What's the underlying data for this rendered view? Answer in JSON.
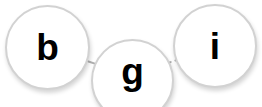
{
  "diagram": {
    "type": "node-link-graph",
    "background_color": "#ffffff",
    "node_fill_color": "#ffffff",
    "node_border_color": "#d2d2d2",
    "label_color": "#000000",
    "edge_color": "#b0b0b0",
    "edge_style": "dashed",
    "nodes": [
      {
        "id": "b",
        "label": "b",
        "cx": 47.5,
        "cy": 47.5,
        "r": 42.5
      },
      {
        "id": "g",
        "label": "g",
        "cx": 132.5,
        "cy": 80.5,
        "r": 41.5
      },
      {
        "id": "i",
        "label": "i",
        "cx": 215,
        "cy": 46,
        "r": 42
      }
    ],
    "edges": [
      {
        "id": "edge-b-g",
        "source": "b",
        "target": "g",
        "x1": 78,
        "y1": 58,
        "x2": 99,
        "y2": 65
      },
      {
        "id": "edge-g-i",
        "source": "g",
        "target": "i",
        "x1": 165,
        "y1": 64,
        "x2": 186,
        "y2": 57
      }
    ]
  }
}
